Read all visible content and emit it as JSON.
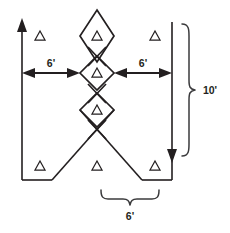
{
  "figure": {
    "background_color": "#ffffff",
    "line_color": "#231f20",
    "brace_color": "#3b3b3d"
  },
  "dimensions": {
    "left_horizontal": {
      "label": "6'",
      "value": 6,
      "unit": "feet",
      "orientation": "horizontal"
    },
    "right_horizontal": {
      "label": "6'",
      "value": 6,
      "unit": "feet",
      "orientation": "horizontal"
    },
    "right_vertical_brace": {
      "label": "10'",
      "value": 10,
      "unit": "feet",
      "orientation": "vertical"
    },
    "bottom_brace": {
      "label": "6'",
      "value": 6,
      "unit": "feet",
      "orientation": "horizontal"
    }
  },
  "markers": {
    "triangle_symbol": "delta-triangle",
    "count": 7,
    "positions": [
      {
        "id": "triangle-top-left",
        "x": 40,
        "y": 36
      },
      {
        "id": "triangle-top-right",
        "x": 155,
        "y": 36
      },
      {
        "id": "triangle-diamond-upper",
        "x": 97,
        "y": 36
      },
      {
        "id": "triangle-diamond-middle",
        "x": 97,
        "y": 73
      },
      {
        "id": "triangle-diamond-lower",
        "x": 97,
        "y": 110
      },
      {
        "id": "triangle-bottom-left",
        "x": 40,
        "y": 166
      },
      {
        "id": "triangle-bottom-center",
        "x": 97,
        "y": 166
      },
      {
        "id": "triangle-bottom-right",
        "x": 155,
        "y": 166
      }
    ]
  },
  "shapes": {
    "diamonds": [
      {
        "id": "diamond-upper",
        "center_x": 97,
        "center_y": 36,
        "half_width": 17,
        "half_height": 26
      },
      {
        "id": "diamond-middle",
        "center_x": 97,
        "center_y": 73,
        "half_width": 17,
        "half_height": 17
      },
      {
        "id": "diamond-lower",
        "center_x": 97,
        "center_y": 110,
        "half_width": 17,
        "half_height": 17
      }
    ],
    "arrows": [
      {
        "id": "left-axis-arrow",
        "direction": "up"
      },
      {
        "id": "right-axis-arrow",
        "direction": "down"
      },
      {
        "id": "left-dim-arrow-start",
        "direction": "left"
      },
      {
        "id": "left-dim-arrow-end",
        "direction": "right"
      },
      {
        "id": "right-dim-arrow-start",
        "direction": "left"
      },
      {
        "id": "right-dim-arrow-end",
        "direction": "right"
      }
    ]
  }
}
